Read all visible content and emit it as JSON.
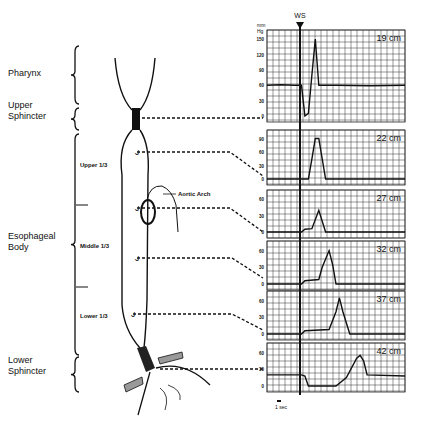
{
  "regions": [
    {
      "label_lines": [
        "Pharynx"
      ],
      "y": 76
    },
    {
      "label_lines": [
        "Upper",
        "Sphincter"
      ],
      "y": 113
    },
    {
      "label_lines": [
        "Esophageal",
        "Body"
      ],
      "y": 244
    },
    {
      "label_lines": [
        "Lower",
        "Sphincter"
      ],
      "y": 368
    }
  ],
  "subregions": [
    {
      "label": "Upper 1/3",
      "y": 167
    },
    {
      "label": "Middle 1/3",
      "y": 248
    },
    {
      "label": "Lower 1/3",
      "y": 318
    }
  ],
  "annotation": {
    "label": "Aortic Arch"
  },
  "swallow_marker": {
    "label": "WS"
  },
  "axis_unit": {
    "line1": "mm",
    "line2": "Hg"
  },
  "time_scale": {
    "label": "1 sec"
  },
  "chart_data": {
    "type": "line",
    "xlabel": "time (1 sec scale bar)",
    "ylabel": "mm Hg",
    "grid": true,
    "panels": [
      {
        "name": "19 cm",
        "yticks": [
          0,
          30,
          60,
          90,
          120,
          150
        ],
        "ylim": [
          0,
          160
        ],
        "description": "Upper sphincter: resting ~60 mmHg, drop to ~0 at swallow then peak ~150",
        "points": [
          [
            0,
            60
          ],
          [
            4,
            61
          ],
          [
            8,
            60
          ],
          [
            10,
            60
          ],
          [
            11,
            0
          ],
          [
            12,
            5
          ],
          [
            13,
            80
          ],
          [
            14,
            150
          ],
          [
            15,
            60
          ],
          [
            20,
            60
          ],
          [
            30,
            59
          ],
          [
            40,
            60
          ]
        ]
      },
      {
        "name": "22 cm",
        "yticks": [
          0,
          30,
          60,
          90
        ],
        "ylim": [
          0,
          100
        ],
        "points": [
          [
            0,
            0
          ],
          [
            10,
            0
          ],
          [
            12,
            0
          ],
          [
            13,
            45
          ],
          [
            14,
            90
          ],
          [
            15,
            90
          ],
          [
            16,
            45
          ],
          [
            17,
            0
          ],
          [
            25,
            0
          ],
          [
            40,
            0
          ]
        ]
      },
      {
        "name": "27 cm",
        "yticks": [
          0,
          30,
          60
        ],
        "ylim": [
          0,
          70
        ],
        "points": [
          [
            0,
            0
          ],
          [
            10,
            0
          ],
          [
            11,
            5
          ],
          [
            13,
            6
          ],
          [
            15,
            40
          ],
          [
            17,
            0
          ],
          [
            25,
            0
          ],
          [
            40,
            0
          ]
        ]
      },
      {
        "name": "32 cm",
        "yticks": [
          0,
          30,
          60
        ],
        "ylim": [
          0,
          70
        ],
        "points": [
          [
            0,
            0
          ],
          [
            10,
            0
          ],
          [
            11,
            6
          ],
          [
            15,
            8
          ],
          [
            16,
            30
          ],
          [
            18,
            60
          ],
          [
            19,
            35
          ],
          [
            20,
            0
          ],
          [
            30,
            0
          ],
          [
            40,
            0
          ]
        ]
      },
      {
        "name": "37 cm",
        "yticks": [
          0,
          30,
          60
        ],
        "ylim": [
          0,
          70
        ],
        "points": [
          [
            0,
            0
          ],
          [
            10,
            0
          ],
          [
            11,
            6
          ],
          [
            18,
            8
          ],
          [
            20,
            40
          ],
          [
            21,
            65
          ],
          [
            22,
            40
          ],
          [
            24,
            0
          ],
          [
            30,
            0
          ],
          [
            40,
            0
          ]
        ]
      },
      {
        "name": "42 cm",
        "yticks": [
          0,
          30,
          60
        ],
        "ylim": [
          0,
          70
        ],
        "description": "Lower sphincter: resting ~20 mmHg, relaxes to ~0 after swallow, then contraction ~55",
        "points": [
          [
            0,
            20
          ],
          [
            10,
            20
          ],
          [
            11,
            18
          ],
          [
            12,
            0
          ],
          [
            20,
            0
          ],
          [
            23,
            15
          ],
          [
            26,
            50
          ],
          [
            27,
            55
          ],
          [
            28,
            45
          ],
          [
            29,
            20
          ],
          [
            40,
            18
          ]
        ]
      }
    ]
  }
}
